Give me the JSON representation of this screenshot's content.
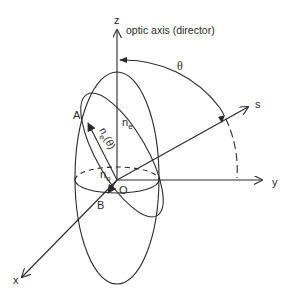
{
  "diagram": {
    "type": "index-ellipsoid",
    "axes": {
      "z": "z",
      "y": "y",
      "x": "x",
      "s": "s"
    },
    "labels": {
      "optic_axis": "optic axis (director)",
      "theta": "θ",
      "point_a": "A",
      "point_b": "B",
      "origin": "O",
      "n_e": "n",
      "n_e_sub": "e",
      "n_e_theta": "n",
      "n_e_theta_sub": "e",
      "n_e_theta_arg": "(θ)",
      "n_o": "n",
      "n_o_sub": "o"
    },
    "colors": {
      "stroke": "#2a2a2a",
      "background": "#ffffff"
    }
  }
}
